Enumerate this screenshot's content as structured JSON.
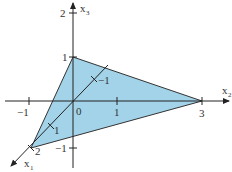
{
  "diagram": {
    "type": "3d-coordinate-plane-triangle",
    "colors": {
      "fill": "#a3d3e8",
      "stroke": "#333333",
      "axis": "#222222"
    },
    "axes": {
      "x1": {
        "label": "x",
        "sub": "1"
      },
      "x2": {
        "label": "x",
        "sub": "2"
      },
      "x3": {
        "label": "x",
        "sub": "3"
      }
    },
    "ticks": {
      "x2_neg1": "−1",
      "origin": "0",
      "x2_1": "1",
      "x2_3": "3",
      "x3_2": "2",
      "x3_1": "1",
      "x3_neg1": "−1",
      "x1_1": "1",
      "x1_2": "2",
      "x1_neg1": "−1"
    },
    "triangle_vertices": [
      {
        "axis": "x1",
        "value": 2
      },
      {
        "axis": "x2",
        "value": 3
      },
      {
        "axis": "x3",
        "value": 1
      }
    ]
  }
}
